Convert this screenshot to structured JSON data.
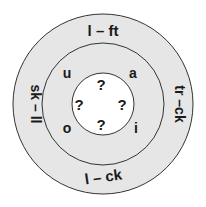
{
  "diagram": {
    "type": "word-wheel",
    "colors": {
      "outer_ring": "#e6e6e6",
      "middle_ring": "#e6e6e6",
      "center": "#ffffff",
      "stroke": "#333333",
      "text": "#1a1a1a"
    },
    "outer_ring_words": [
      {
        "position": "top",
        "text": "l – ft"
      },
      {
        "position": "right",
        "text": "tr –ck"
      },
      {
        "position": "bottom",
        "text": "l – ck"
      },
      {
        "position": "left",
        "text": "sk – ll"
      }
    ],
    "middle_ring_vowels": [
      {
        "position": "top-left",
        "text": "u"
      },
      {
        "position": "top-right",
        "text": "a"
      },
      {
        "position": "bottom-left",
        "text": "o"
      },
      {
        "position": "bottom-right",
        "text": "i"
      }
    ],
    "center_marks": [
      {
        "position": "top",
        "text": "?"
      },
      {
        "position": "left",
        "text": "?"
      },
      {
        "position": "right",
        "text": "?"
      },
      {
        "position": "bottom",
        "text": "?"
      }
    ]
  }
}
